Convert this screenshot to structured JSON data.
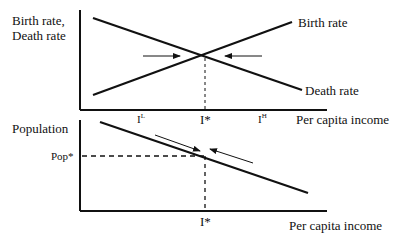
{
  "top_panel": {
    "y_axis_label_line1": "Birth rate,",
    "y_axis_label_line2": "Death rate",
    "x_axis_label": "Per capita income",
    "series": [
      {
        "name": "Birth rate",
        "label": "Birth rate",
        "trend": "increasing",
        "from": [
          93,
          95
        ],
        "to": [
          292,
          22
        ]
      },
      {
        "name": "Death rate",
        "label": "Death rate",
        "trend": "decreasing",
        "from": [
          93,
          18
        ],
        "to": [
          302,
          90
        ]
      }
    ],
    "ticks": {
      "low": {
        "base": "I",
        "sup": "L"
      },
      "star": "I*",
      "high": {
        "base": "I",
        "sup": "H"
      }
    },
    "annotations": [
      "arrow from I^L toward equilibrium",
      "arrow from I^H toward equilibrium",
      "dashed line at I*"
    ]
  },
  "bottom_panel": {
    "y_axis_label": "Population",
    "y_tick": "Pop*",
    "x_tick": "I*",
    "x_axis_label": "Per capita income",
    "curve": {
      "trend": "decreasing",
      "from": [
        100,
        122
      ],
      "to": [
        308,
        193
      ]
    },
    "annotations": [
      "parallel arrows converging on Pop* along curve",
      "dashed guide lines to Pop* and I*"
    ]
  },
  "colors": {
    "ink": "#111111",
    "background": "#ffffff"
  }
}
